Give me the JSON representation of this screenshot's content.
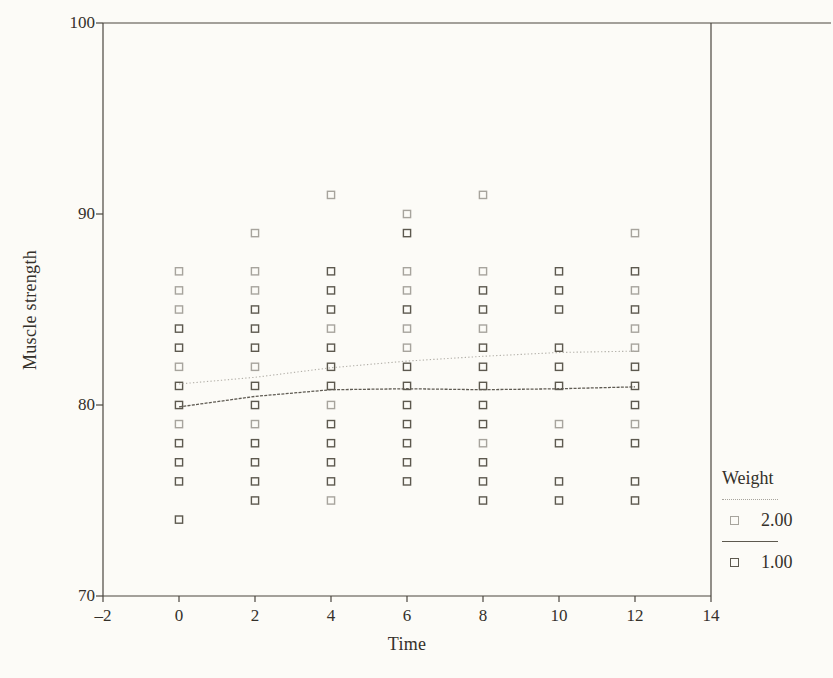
{
  "chart_data": {
    "type": "scatter",
    "title": "",
    "xlabel": "Time",
    "ylabel": "Muscle strength",
    "xlim": [
      -2,
      14
    ],
    "ylim": [
      70,
      100
    ],
    "grid": false,
    "x_ticks": [
      -2,
      0,
      2,
      4,
      6,
      8,
      10,
      12,
      14
    ],
    "x_tick_labels": [
      "–2",
      "0",
      "2",
      "4",
      "6",
      "8",
      "10",
      "12",
      "14"
    ],
    "y_ticks": [
      70,
      80,
      90,
      100
    ],
    "y_tick_labels": [
      "70",
      "80",
      "90",
      "100"
    ],
    "legend": {
      "title": "Weight",
      "position": "right-bottom-outside",
      "entries": [
        {
          "label": "2.00",
          "color": "#a7a49d",
          "line_style": "dotted",
          "marker": "open-square"
        },
        {
          "label": "1.00",
          "color": "#5d594f",
          "line_style": "solid",
          "marker": "open-square"
        }
      ]
    },
    "series": [
      {
        "name": "Weight 2.00 observations",
        "marker": "open-square",
        "color": "#a7a49d",
        "points": [
          [
            0,
            87
          ],
          [
            0,
            86
          ],
          [
            0,
            85
          ],
          [
            0,
            82
          ],
          [
            0,
            79
          ],
          [
            2,
            89
          ],
          [
            2,
            87
          ],
          [
            2,
            86
          ],
          [
            2,
            82
          ],
          [
            2,
            79
          ],
          [
            4,
            91
          ],
          [
            4,
            84
          ],
          [
            4,
            80
          ],
          [
            4,
            75
          ],
          [
            6,
            90
          ],
          [
            6,
            87
          ],
          [
            6,
            86
          ],
          [
            6,
            84
          ],
          [
            6,
            83
          ],
          [
            8,
            91
          ],
          [
            8,
            87
          ],
          [
            8,
            84
          ],
          [
            8,
            78
          ],
          [
            10,
            79
          ],
          [
            12,
            89
          ],
          [
            12,
            86
          ],
          [
            12,
            84
          ],
          [
            12,
            83
          ],
          [
            12,
            79
          ]
        ]
      },
      {
        "name": "Weight 1.00 observations",
        "marker": "open-square",
        "color": "#5d594f",
        "points": [
          [
            0,
            84
          ],
          [
            0,
            83
          ],
          [
            0,
            81
          ],
          [
            0,
            80
          ],
          [
            0,
            78
          ],
          [
            0,
            77
          ],
          [
            0,
            76
          ],
          [
            0,
            74
          ],
          [
            2,
            85
          ],
          [
            2,
            84
          ],
          [
            2,
            83
          ],
          [
            2,
            81
          ],
          [
            2,
            80
          ],
          [
            2,
            78
          ],
          [
            2,
            77
          ],
          [
            2,
            76
          ],
          [
            2,
            75
          ],
          [
            4,
            87
          ],
          [
            4,
            86
          ],
          [
            4,
            85
          ],
          [
            4,
            83
          ],
          [
            4,
            82
          ],
          [
            4,
            81
          ],
          [
            4,
            79
          ],
          [
            4,
            78
          ],
          [
            4,
            77
          ],
          [
            4,
            76
          ],
          [
            6,
            89
          ],
          [
            6,
            85
          ],
          [
            6,
            82
          ],
          [
            6,
            81
          ],
          [
            6,
            80
          ],
          [
            6,
            79
          ],
          [
            6,
            78
          ],
          [
            6,
            77
          ],
          [
            6,
            76
          ],
          [
            8,
            86
          ],
          [
            8,
            85
          ],
          [
            8,
            83
          ],
          [
            8,
            82
          ],
          [
            8,
            81
          ],
          [
            8,
            80
          ],
          [
            8,
            79
          ],
          [
            8,
            77
          ],
          [
            8,
            76
          ],
          [
            8,
            75
          ],
          [
            10,
            87
          ],
          [
            10,
            86
          ],
          [
            10,
            85
          ],
          [
            10,
            83
          ],
          [
            10,
            82
          ],
          [
            10,
            81
          ],
          [
            10,
            78
          ],
          [
            10,
            76
          ],
          [
            10,
            75
          ],
          [
            12,
            87
          ],
          [
            12,
            85
          ],
          [
            12,
            82
          ],
          [
            12,
            81
          ],
          [
            12,
            80
          ],
          [
            12,
            78
          ],
          [
            12,
            76
          ],
          [
            12,
            75
          ]
        ]
      }
    ],
    "fit_lines": [
      {
        "name": "Weight 2.00 fit",
        "color": "#b2afa8",
        "style": "dotted",
        "points": [
          [
            0,
            81.1
          ],
          [
            2,
            81.45
          ],
          [
            4,
            81.95
          ],
          [
            6,
            82.3
          ],
          [
            8,
            82.55
          ],
          [
            10,
            82.75
          ],
          [
            12,
            82.82
          ]
        ]
      },
      {
        "name": "Weight 1.00 fit",
        "color": "#5f5b53",
        "style": "dense-dotted",
        "points": [
          [
            0,
            79.9
          ],
          [
            2,
            80.45
          ],
          [
            4,
            80.8
          ],
          [
            6,
            80.85
          ],
          [
            8,
            80.8
          ],
          [
            10,
            80.85
          ],
          [
            12,
            80.95
          ]
        ]
      }
    ]
  }
}
